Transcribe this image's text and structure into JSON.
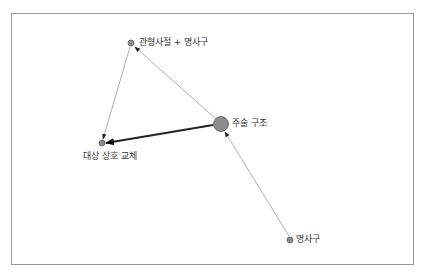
{
  "diagram": {
    "type": "directed-network",
    "nodes": [
      {
        "id": "n1",
        "label": "관형사절 + 명사구",
        "x": 131,
        "y": 43,
        "r": 3.5
      },
      {
        "id": "n2",
        "label": "주술 구조",
        "x": 221,
        "y": 124,
        "r": 7.5
      },
      {
        "id": "n3",
        "label": "대상 상호 교체",
        "x": 102,
        "y": 143,
        "r": 3.5
      },
      {
        "id": "n4",
        "label": "명사구",
        "x": 290,
        "y": 240,
        "r": 3.5
      }
    ],
    "edges": [
      {
        "from": "n2",
        "to": "n1",
        "weight": "thin"
      },
      {
        "from": "n1",
        "to": "n3",
        "weight": "thin"
      },
      {
        "from": "n2",
        "to": "n3",
        "weight": "thick"
      },
      {
        "from": "n4",
        "to": "n2",
        "weight": "thin"
      }
    ],
    "colors": {
      "node_fill": "#8c8c8c",
      "node_stroke": "#5a5a5a",
      "edge": "#9a9a9a",
      "edge_thick": "#222222",
      "frame": "#9a9a9a"
    }
  }
}
